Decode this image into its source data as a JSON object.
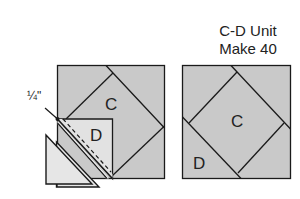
{
  "title": {
    "line1": "C-D Unit",
    "line2": "Make 40"
  },
  "left_diagram": {
    "label_c": "C",
    "label_d": "D",
    "seam_allowance": "1/4\"",
    "seam_allowance_display": "¼\""
  },
  "right_diagram": {
    "label_c": "C",
    "label_d": "D"
  },
  "colors": {
    "block_fill": "#c9c9c9",
    "patch_d_fill": "#e2e2e2",
    "trim_fill": "#e6e6e6",
    "stroke": "#1a1a1a",
    "background": "#ffffff"
  }
}
